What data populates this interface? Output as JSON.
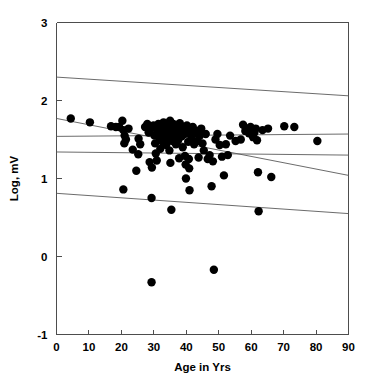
{
  "chart_data": {
    "type": "scatter",
    "title": "",
    "xlabel": "Age in Yrs",
    "ylabel": "Log, mV",
    "xlim": [
      0,
      90
    ],
    "ylim": [
      -1,
      3
    ],
    "xticks": [
      0,
      10,
      20,
      30,
      40,
      50,
      60,
      70,
      80,
      90
    ],
    "yticks": [
      -1,
      0,
      1,
      2,
      3
    ],
    "xtick_labels": [
      "0",
      "10",
      "20",
      "30",
      "40",
      "50",
      "60",
      "70",
      "80",
      "90"
    ],
    "ytick_labels": [
      "-1",
      "0",
      "1",
      "2",
      "3"
    ],
    "grid": false,
    "legend": null,
    "point_color": "#000000",
    "line_color": "#5a5a5a",
    "axis_color": "#4d4d4d",
    "point_radius_px": 4.2,
    "series": [
      {
        "name": "observations",
        "marker": "filled-circle",
        "points": [
          [
            4.4,
            1.77
          ],
          [
            10.3,
            1.72
          ],
          [
            16.8,
            1.67
          ],
          [
            18.3,
            1.66
          ],
          [
            19.3,
            1.66
          ],
          [
            20.3,
            1.74
          ],
          [
            20.6,
            1.62
          ],
          [
            21.0,
            1.55
          ],
          [
            20.9,
            1.45
          ],
          [
            20.6,
            0.86
          ],
          [
            21.4,
            1.5
          ],
          [
            22.2,
            1.64
          ],
          [
            23.5,
            1.37
          ],
          [
            24.6,
            1.1
          ],
          [
            25.3,
            1.51
          ],
          [
            25.2,
            1.31
          ],
          [
            25.8,
            1.44
          ],
          [
            27.3,
            1.66
          ],
          [
            28.0,
            1.7
          ],
          [
            28.4,
            1.59
          ],
          [
            28.7,
            1.21
          ],
          [
            29.0,
            1.63
          ],
          [
            29.3,
            0.75
          ],
          [
            29.4,
            1.14
          ],
          [
            29.9,
            1.68
          ],
          [
            30.2,
            1.55
          ],
          [
            30.4,
            1.45
          ],
          [
            30.6,
            1.32
          ],
          [
            30.9,
            1.23
          ],
          [
            31.1,
            1.62
          ],
          [
            31.4,
            1.7
          ],
          [
            31.7,
            1.52
          ],
          [
            32.0,
            1.38
          ],
          [
            32.2,
            1.66
          ],
          [
            32.5,
            1.58
          ],
          [
            32.7,
            1.47
          ],
          [
            33.0,
            1.72
          ],
          [
            33.2,
            1.63
          ],
          [
            33.5,
            1.55
          ],
          [
            33.8,
            1.43
          ],
          [
            34.0,
            1.68
          ],
          [
            34.3,
            1.6
          ],
          [
            34.5,
            1.5
          ],
          [
            34.8,
            1.36
          ],
          [
            35.0,
            1.74
          ],
          [
            35.2,
            1.65
          ],
          [
            35.5,
            1.57
          ],
          [
            35.7,
            1.48
          ],
          [
            35.1,
            1.2
          ],
          [
            35.4,
            0.6
          ],
          [
            36.0,
            1.7
          ],
          [
            36.3,
            1.61
          ],
          [
            36.5,
            1.52
          ],
          [
            36.8,
            1.44
          ],
          [
            37.0,
            1.67
          ],
          [
            37.3,
            1.58
          ],
          [
            37.5,
            1.49
          ],
          [
            37.8,
            1.26
          ],
          [
            38.0,
            1.71
          ],
          [
            38.3,
            1.63
          ],
          [
            38.6,
            1.54
          ],
          [
            38.9,
            1.4
          ],
          [
            39.2,
            1.66
          ],
          [
            39.5,
            1.57
          ],
          [
            39.6,
            1.29
          ],
          [
            39.8,
            1.18
          ],
          [
            39.9,
            1.0
          ],
          [
            40.2,
            1.68
          ],
          [
            40.4,
            1.59
          ],
          [
            40.6,
            1.47
          ],
          [
            40.8,
            1.25
          ],
          [
            40.9,
            1.13
          ],
          [
            41.0,
            0.85
          ],
          [
            41.3,
            1.62
          ],
          [
            41.6,
            1.53
          ],
          [
            42.0,
            1.66
          ],
          [
            42.4,
            1.44
          ],
          [
            42.8,
            1.58
          ],
          [
            43.2,
            1.61
          ],
          [
            43.5,
            1.48
          ],
          [
            43.8,
            1.27
          ],
          [
            44.2,
            1.55
          ],
          [
            44.6,
            1.64
          ],
          [
            45.0,
            1.45
          ],
          [
            45.4,
            1.36
          ],
          [
            46.0,
            1.57
          ],
          [
            46.6,
            1.25
          ],
          [
            47.2,
            1.3
          ],
          [
            47.8,
            0.9
          ],
          [
            48.2,
            1.22
          ],
          [
            48.5,
            -0.17
          ],
          [
            49.0,
            1.5
          ],
          [
            49.6,
            1.57
          ],
          [
            50.3,
            1.43
          ],
          [
            51.0,
            1.28
          ],
          [
            51.6,
            1.04
          ],
          [
            52.2,
            1.44
          ],
          [
            52.8,
            1.3
          ],
          [
            53.5,
            1.55
          ],
          [
            55.2,
            1.48
          ],
          [
            56.8,
            1.5
          ],
          [
            57.5,
            1.69
          ],
          [
            58.2,
            1.61
          ],
          [
            58.8,
            1.64
          ],
          [
            59.3,
            1.58
          ],
          [
            59.8,
            1.66
          ],
          [
            60.2,
            1.62
          ],
          [
            60.6,
            1.53
          ],
          [
            61.0,
            1.59
          ],
          [
            61.4,
            1.64
          ],
          [
            61.8,
            1.49
          ],
          [
            62.1,
            1.08
          ],
          [
            62.3,
            0.58
          ],
          [
            63.5,
            1.62
          ],
          [
            65.2,
            1.64
          ],
          [
            66.2,
            1.02
          ],
          [
            70.2,
            1.67
          ],
          [
            73.3,
            1.66
          ],
          [
            80.4,
            1.48
          ],
          [
            29.3,
            -0.33
          ]
        ]
      }
    ],
    "fit_lines": [
      {
        "name": "upper-prediction-band",
        "x": [
          0,
          90
        ],
        "y": [
          2.3,
          2.06
        ]
      },
      {
        "name": "upper-confidence-band",
        "x": [
          0,
          90
        ],
        "y": [
          1.54,
          1.57
        ]
      },
      {
        "name": "regression-line",
        "x": [
          0,
          90
        ],
        "y": [
          1.77,
          1.04
        ]
      },
      {
        "name": "lower-confidence-band",
        "x": [
          0,
          90
        ],
        "y": [
          1.34,
          1.3
        ]
      },
      {
        "name": "lower-prediction-band",
        "x": [
          0,
          90
        ],
        "y": [
          0.81,
          0.55
        ]
      }
    ]
  }
}
